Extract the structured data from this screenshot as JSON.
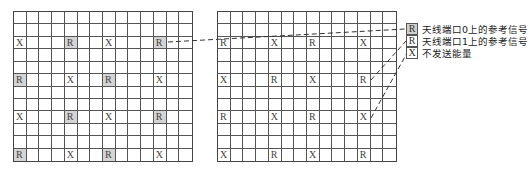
{
  "diagram": {
    "type": "resource-grid-pilot-pattern",
    "grid_rows": 12,
    "grid_cols": 14,
    "left_grid": {
      "label": "antenna-port-0",
      "cells": [
        {
          "row": 2,
          "col": 0,
          "symbol": "X",
          "shaded": false
        },
        {
          "row": 2,
          "col": 4,
          "symbol": "R",
          "shaded": true
        },
        {
          "row": 2,
          "col": 7,
          "symbol": "X",
          "shaded": false
        },
        {
          "row": 2,
          "col": 11,
          "symbol": "R",
          "shaded": true
        },
        {
          "row": 5,
          "col": 0,
          "symbol": "R",
          "shaded": true
        },
        {
          "row": 5,
          "col": 4,
          "symbol": "X",
          "shaded": false
        },
        {
          "row": 5,
          "col": 7,
          "symbol": "R",
          "shaded": true
        },
        {
          "row": 5,
          "col": 11,
          "symbol": "X",
          "shaded": false
        },
        {
          "row": 8,
          "col": 0,
          "symbol": "X",
          "shaded": false
        },
        {
          "row": 8,
          "col": 4,
          "symbol": "R",
          "shaded": true
        },
        {
          "row": 8,
          "col": 7,
          "symbol": "X",
          "shaded": false
        },
        {
          "row": 8,
          "col": 11,
          "symbol": "R",
          "shaded": true
        },
        {
          "row": 11,
          "col": 0,
          "symbol": "R",
          "shaded": true
        },
        {
          "row": 11,
          "col": 4,
          "symbol": "X",
          "shaded": false
        },
        {
          "row": 11,
          "col": 7,
          "symbol": "R",
          "shaded": true
        },
        {
          "row": 11,
          "col": 11,
          "symbol": "X",
          "shaded": false
        }
      ]
    },
    "right_grid": {
      "label": "antenna-port-1",
      "cells": [
        {
          "row": 2,
          "col": 0,
          "symbol": "R",
          "shaded": false
        },
        {
          "row": 2,
          "col": 4,
          "symbol": "X",
          "shaded": false
        },
        {
          "row": 2,
          "col": 7,
          "symbol": "R",
          "shaded": false
        },
        {
          "row": 2,
          "col": 11,
          "symbol": "X",
          "shaded": false
        },
        {
          "row": 5,
          "col": 0,
          "symbol": "X",
          "shaded": false
        },
        {
          "row": 5,
          "col": 4,
          "symbol": "R",
          "shaded": false
        },
        {
          "row": 5,
          "col": 7,
          "symbol": "X",
          "shaded": false
        },
        {
          "row": 5,
          "col": 11,
          "symbol": "R",
          "shaded": false
        },
        {
          "row": 8,
          "col": 0,
          "symbol": "R",
          "shaded": false
        },
        {
          "row": 8,
          "col": 4,
          "symbol": "X",
          "shaded": false
        },
        {
          "row": 8,
          "col": 7,
          "symbol": "R",
          "shaded": false
        },
        {
          "row": 8,
          "col": 11,
          "symbol": "X",
          "shaded": false
        },
        {
          "row": 11,
          "col": 0,
          "symbol": "X",
          "shaded": false
        },
        {
          "row": 11,
          "col": 4,
          "symbol": "R",
          "shaded": false
        },
        {
          "row": 11,
          "col": 7,
          "symbol": "X",
          "shaded": false
        },
        {
          "row": 11,
          "col": 11,
          "symbol": "R",
          "shaded": false
        }
      ]
    },
    "legend": [
      {
        "symbol": "R",
        "shaded": true,
        "text": "天线端口0上的参考信号"
      },
      {
        "symbol": "R",
        "shaded": false,
        "text": "天线端口1上的参考信号"
      },
      {
        "symbol": "X",
        "shaded": false,
        "text": "不发送能量"
      }
    ],
    "colors": {
      "grid_line": "#555555",
      "shaded_cell": "#d4d4d4",
      "connector": "#333333"
    }
  }
}
